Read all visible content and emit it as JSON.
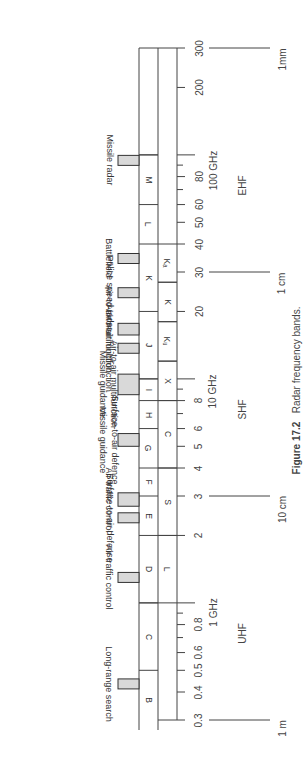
{
  "chart_data": {
    "type": "diagram",
    "title": "Radar frequency bands.",
    "figure_number": "Figure 17.2",
    "scale": "logarithmic frequency (GHz), rotated 90°",
    "axis_range_ghz": [
      0.3,
      300
    ],
    "tick_labels": [
      {
        "value": 0.3,
        "label": "0.3"
      },
      {
        "value": 0.4,
        "label": "0.4"
      },
      {
        "value": 0.5,
        "label": "0.5"
      },
      {
        "value": 0.6,
        "label": "0.6"
      },
      {
        "value": 0.8,
        "label": "0.8"
      },
      {
        "value": 1,
        "label": "1 GHz"
      },
      {
        "value": 2,
        "label": "2"
      },
      {
        "value": 3,
        "label": "3"
      },
      {
        "value": 4,
        "label": "4"
      },
      {
        "value": 5,
        "label": "5"
      },
      {
        "value": 6,
        "label": "6"
      },
      {
        "value": 8,
        "label": "8"
      },
      {
        "value": 10,
        "label": "10 GHz"
      },
      {
        "value": 20,
        "label": "20"
      },
      {
        "value": 30,
        "label": "30"
      },
      {
        "value": 40,
        "label": "40"
      },
      {
        "value": 50,
        "label": "50"
      },
      {
        "value": 60,
        "label": "60"
      },
      {
        "value": 80,
        "label": "80"
      },
      {
        "value": 100,
        "label": "100 GHz"
      },
      {
        "value": 200,
        "label": "200"
      },
      {
        "value": 300,
        "label": "300"
      }
    ],
    "minor_ticks": [
      0.7,
      0.9,
      7,
      9,
      70,
      90
    ],
    "nato_bands": [
      {
        "name": "B",
        "from": 0.25,
        "to": 0.5
      },
      {
        "name": "C",
        "from": 0.5,
        "to": 1
      },
      {
        "name": "D",
        "from": 1,
        "to": 2
      },
      {
        "name": "E",
        "from": 2,
        "to": 3
      },
      {
        "name": "F",
        "from": 3,
        "to": 4
      },
      {
        "name": "G",
        "from": 4,
        "to": 6
      },
      {
        "name": "H",
        "from": 6,
        "to": 8
      },
      {
        "name": "I",
        "from": 8,
        "to": 10
      },
      {
        "name": "J",
        "from": 10,
        "to": 20
      },
      {
        "name": "K",
        "from": 20,
        "to": 40
      },
      {
        "name": "L",
        "from": 40,
        "to": 60
      },
      {
        "name": "M",
        "from": 60,
        "to": 100
      }
    ],
    "ieee_bands": [
      {
        "name": "L",
        "from": 1,
        "to": 2
      },
      {
        "name": "S",
        "from": 2,
        "to": 4
      },
      {
        "name": "C",
        "from": 4,
        "to": 8
      },
      {
        "name": "X",
        "from": 8,
        "to": 12
      },
      {
        "name": "KU",
        "from": 12,
        "to": 18
      },
      {
        "name": "K",
        "from": 18,
        "to": 27
      },
      {
        "name": "KA",
        "from": 27,
        "to": 40
      }
    ],
    "applications": [
      {
        "label": "Long-range search",
        "from": 0.42,
        "to": 0.45
      },
      {
        "label": "Air traffic control",
        "from": 1.25,
        "to": 1.35
      },
      {
        "label": "Surface-to-air defense",
        "from": 2.3,
        "to": 2.5
      },
      {
        "label": "Air traffic control",
        "from": 2.7,
        "to": 3.1
      },
      {
        "label": "Surface-to-air defence / Missile guidance",
        "from": 5.0,
        "to": 5.7
      },
      {
        "label": "Air-to-air multifunction / Missile guidance",
        "from": 8.5,
        "to": 10.5
      },
      {
        "label": "Air-to-air multifunction",
        "from": 13.4,
        "to": 14.0
      },
      {
        "label": "Air-to-air multifunction",
        "from": 15.7,
        "to": 17.7
      },
      {
        "label": "Police speed radar",
        "from": 24,
        "to": 24.5
      },
      {
        "label": "Battlefield",
        "from": 33,
        "to": 36
      },
      {
        "label": "Missile radar",
        "from": 94,
        "to": 95
      }
    ],
    "wavelength_markers": [
      {
        "label": "1 m",
        "ghz": 0.3
      },
      {
        "label": "10 cm",
        "ghz": 3
      },
      {
        "label": "1 cm",
        "ghz": 30
      },
      {
        "label": "1mm",
        "ghz": 300
      }
    ],
    "regions": [
      {
        "label": "UHF",
        "near_ghz": 0.9
      },
      {
        "label": "SHF",
        "near_ghz": 9
      },
      {
        "label": "EHF",
        "near_ghz": 90
      }
    ]
  }
}
